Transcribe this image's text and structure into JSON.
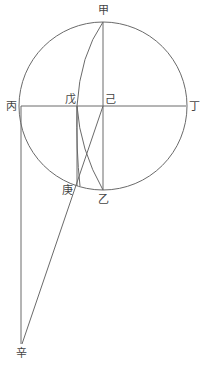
{
  "diagram": {
    "type": "geometric-construction",
    "stroke_color": "#6a6a6a",
    "label_color": "#444444",
    "circle": {
      "cx": 103,
      "cy": 106,
      "r": 84
    },
    "points": {
      "jia": {
        "label": "甲",
        "x": 103,
        "y": 21
      },
      "yi": {
        "label": "乙",
        "x": 103,
        "y": 190
      },
      "bing": {
        "label": "丙",
        "x": 21,
        "y": 106
      },
      "ding": {
        "label": "丁",
        "x": 186,
        "y": 106
      },
      "wu": {
        "label": "戊",
        "x": 77,
        "y": 106
      },
      "ji": {
        "label": "己",
        "x": 103,
        "y": 106
      },
      "geng": {
        "label": "庚",
        "x": 77,
        "y": 186
      },
      "xin": {
        "label": "辛",
        "x": 22,
        "y": 344
      }
    },
    "labels": {
      "jia": "甲",
      "yi": "乙",
      "bing": "丙",
      "ding": "丁",
      "wu": "戊",
      "ji": "己",
      "geng": "庚",
      "xin": "辛"
    }
  }
}
